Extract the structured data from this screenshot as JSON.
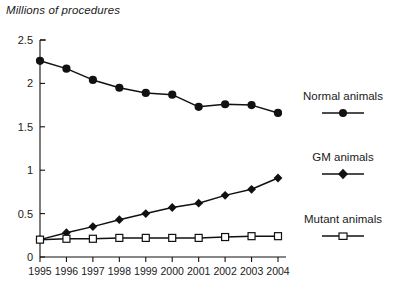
{
  "chart_data": {
    "type": "line",
    "title": "Millions of procedures",
    "xlabel": "",
    "ylabel": "Millions of procedures",
    "categories": [
      "1995",
      "1996",
      "1997",
      "1998",
      "1999",
      "2000",
      "2001",
      "2002",
      "2003",
      "2004"
    ],
    "x": [
      1995,
      1996,
      1997,
      1998,
      1999,
      2000,
      2001,
      2002,
      2003,
      2004
    ],
    "xlim": [
      1995,
      2004
    ],
    "ylim": [
      0,
      2.5
    ],
    "yticks": [
      0,
      0.5,
      1,
      1.5,
      2,
      2.5
    ],
    "ytick_labels": [
      "0",
      "0.5",
      "1",
      "1.5",
      "2",
      "2.5"
    ],
    "grid": false,
    "legend_position": "right",
    "series": [
      {
        "name": "Normal animals",
        "marker": "filled-circle",
        "color": "#111111",
        "values": [
          2.26,
          2.17,
          2.04,
          1.95,
          1.89,
          1.87,
          1.73,
          1.76,
          1.75,
          1.66
        ]
      },
      {
        "name": "GM animals",
        "marker": "filled-diamond",
        "color": "#111111",
        "values": [
          0.2,
          0.28,
          0.35,
          0.43,
          0.5,
          0.57,
          0.62,
          0.71,
          0.78,
          0.91
        ]
      },
      {
        "name": "Mutant animals",
        "marker": "open-square",
        "color": "#111111",
        "values": [
          0.2,
          0.21,
          0.21,
          0.22,
          0.22,
          0.22,
          0.22,
          0.23,
          0.24,
          0.24
        ]
      }
    ]
  },
  "legend": {
    "entries": [
      {
        "label": "Normal animals",
        "marker": "filled-circle"
      },
      {
        "label": "GM animals",
        "marker": "filled-diamond"
      },
      {
        "label": "Mutant animals",
        "marker": "open-square"
      }
    ]
  }
}
